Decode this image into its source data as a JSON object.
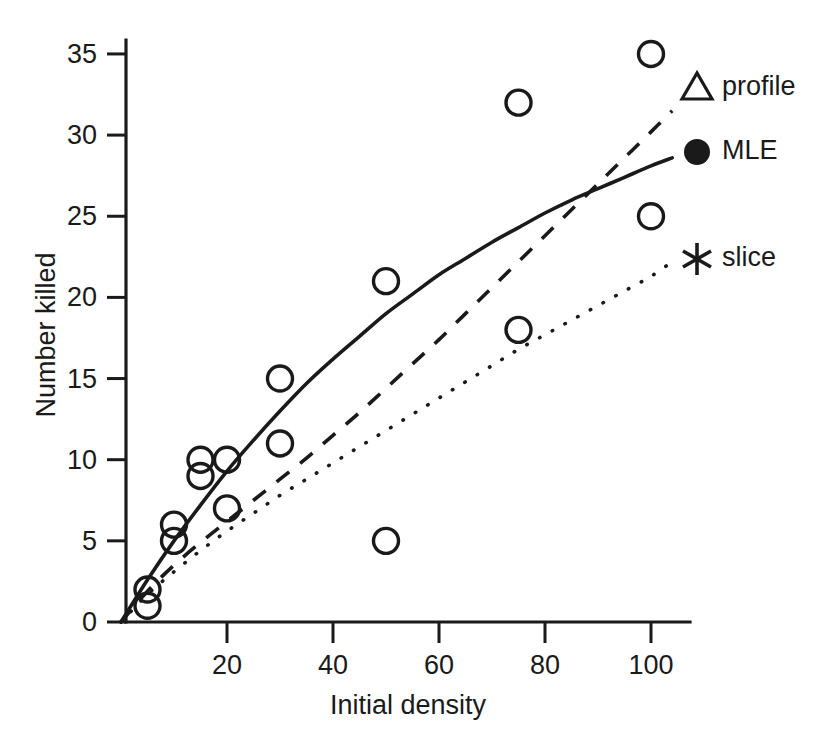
{
  "chart_data": {
    "type": "scatter",
    "title": "",
    "xlabel": "Initial density",
    "ylabel": "Number killed",
    "xlim": [
      0,
      107
    ],
    "ylim": [
      0,
      37
    ],
    "grid": false,
    "legend_position": "right",
    "x_ticks": [
      20,
      40,
      60,
      80,
      100
    ],
    "x_tick_labels": [
      "20",
      "40",
      "60",
      "80",
      "100"
    ],
    "y_ticks": [
      0,
      5,
      10,
      15,
      20,
      25,
      30,
      35
    ],
    "y_tick_labels": [
      "0",
      "5",
      "10",
      "15",
      "20",
      "25",
      "30",
      "35"
    ],
    "points": {
      "name": "observed data",
      "marker": "open-circle",
      "x": [
        5,
        5,
        10,
        10,
        15,
        15,
        20,
        20,
        30,
        30,
        50,
        50,
        75,
        75,
        100,
        100
      ],
      "y": [
        2,
        1,
        6,
        5,
        10,
        9,
        10,
        7,
        15,
        11,
        21,
        5,
        32,
        18,
        35,
        25
      ]
    },
    "series": [
      {
        "name": "MLE",
        "style": "solid",
        "marker": "filled-circle",
        "x": [
          0,
          5,
          10,
          15,
          20,
          25,
          30,
          35,
          40,
          45,
          50,
          55,
          60,
          65,
          70,
          75,
          80,
          85,
          90,
          95,
          100,
          104
        ],
        "y": [
          0.0,
          2.6,
          5.0,
          7.2,
          9.3,
          11.2,
          13.0,
          14.7,
          16.2,
          17.6,
          19.0,
          20.2,
          21.4,
          22.4,
          23.4,
          24.3,
          25.2,
          26.0,
          26.7,
          27.4,
          28.1,
          28.6
        ]
      },
      {
        "name": "profile",
        "style": "dashed",
        "marker": "open-triangle",
        "x": [
          0,
          5,
          10,
          15,
          20,
          25,
          30,
          35,
          40,
          45,
          50,
          55,
          60,
          65,
          70,
          75,
          80,
          85,
          90,
          95,
          100,
          104
        ],
        "y": [
          0.0,
          1.9,
          3.5,
          4.9,
          6.2,
          7.5,
          8.8,
          10.1,
          11.5,
          12.9,
          14.4,
          15.9,
          17.4,
          19.0,
          20.6,
          22.2,
          23.8,
          25.4,
          27.0,
          28.6,
          30.2,
          31.5
        ]
      },
      {
        "name": "slice",
        "style": "dotted",
        "marker": "asterisk",
        "x": [
          0,
          5,
          10,
          15,
          20,
          25,
          30,
          35,
          40,
          45,
          50,
          55,
          60,
          65,
          70,
          75,
          80,
          85,
          90,
          95,
          100,
          104
        ],
        "y": [
          0.0,
          1.7,
          3.1,
          4.4,
          5.6,
          6.7,
          7.8,
          8.8,
          9.8,
          10.8,
          11.8,
          12.8,
          13.8,
          14.8,
          15.8,
          16.8,
          17.7,
          18.6,
          19.5,
          20.4,
          21.3,
          22.2
        ]
      }
    ],
    "legend": [
      {
        "label": "profile",
        "marker": "open-triangle"
      },
      {
        "label": "MLE",
        "marker": "filled-circle"
      },
      {
        "label": "slice",
        "marker": "asterisk"
      }
    ],
    "colors": {
      "foreground": "#1a1a1a",
      "background": "#ffffff"
    }
  }
}
